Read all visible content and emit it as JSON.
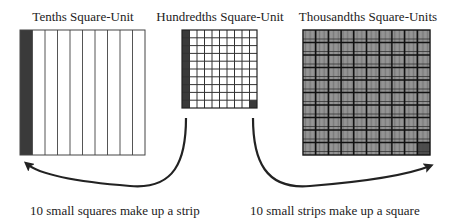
{
  "titles": {
    "tenths": "Tenths Square-Unit",
    "hundredths": "Hundredths Square-Unit",
    "thousandths": "Thousandths Square-Units"
  },
  "captions": {
    "left": "10 small squares make up a strip",
    "right": "10 small strips make up a square"
  },
  "grids": {
    "tenths": {
      "x": 20,
      "y": 30,
      "w": 125,
      "h": 125,
      "cols": 10,
      "rows": 1,
      "shaded": "first-column-strip"
    },
    "hundredths": {
      "x": 182,
      "y": 30,
      "w": 75,
      "h": 78,
      "cols": 10,
      "rows": 10,
      "shaded": "first-column + bottom-right-cell"
    },
    "thousandths": {
      "x": 303,
      "y": 30,
      "w": 127,
      "h": 125,
      "cols": 10,
      "rows": 10,
      "subcols": 10,
      "shaded": "bottom-right-cell"
    }
  },
  "colors": {
    "shade": "#3a3a3a",
    "line": "#222222",
    "background": "#ffffff"
  },
  "arrows": [
    {
      "name": "hundredths-to-tenths-arrow",
      "from": [
        186,
        118
      ],
      "to": [
        26,
        160
      ]
    },
    {
      "name": "hundredths-to-thousandths-arrow",
      "from": [
        253,
        118
      ],
      "to": [
        432,
        162
      ]
    }
  ]
}
